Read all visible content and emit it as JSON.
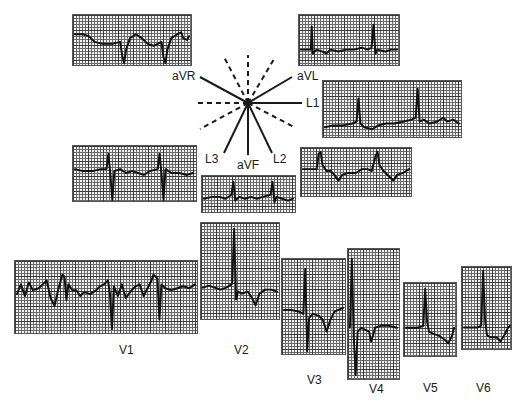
{
  "diagram": {
    "hexaxial": {
      "solid_axes": [
        "aVR",
        "aVL",
        "L1",
        "L2",
        "aVF",
        "L3"
      ],
      "labels": {
        "aVR": "aVR",
        "aVL": "aVL",
        "L1": "L1",
        "L2": "L2",
        "L3": "L3",
        "aVF": "aVF"
      }
    },
    "limb_leads": [
      {
        "id": "aVR",
        "label": "aVR"
      },
      {
        "id": "aVL",
        "label": "aVL"
      },
      {
        "id": "L1",
        "label": "L1"
      },
      {
        "id": "L3",
        "label": "L3"
      },
      {
        "id": "L2",
        "label": "L2"
      },
      {
        "id": "aVF",
        "label": "aVF"
      }
    ],
    "chest_leads": [
      {
        "id": "V1",
        "label": "V1"
      },
      {
        "id": "V2",
        "label": "V2"
      },
      {
        "id": "V3",
        "label": "V3"
      },
      {
        "id": "V4",
        "label": "V4"
      },
      {
        "id": "V5",
        "label": "V5"
      },
      {
        "id": "V6",
        "label": "V6"
      }
    ],
    "colors": {
      "trace": "#111111",
      "grid": "#3a3a3a",
      "paper": "#f2f2f2"
    }
  }
}
